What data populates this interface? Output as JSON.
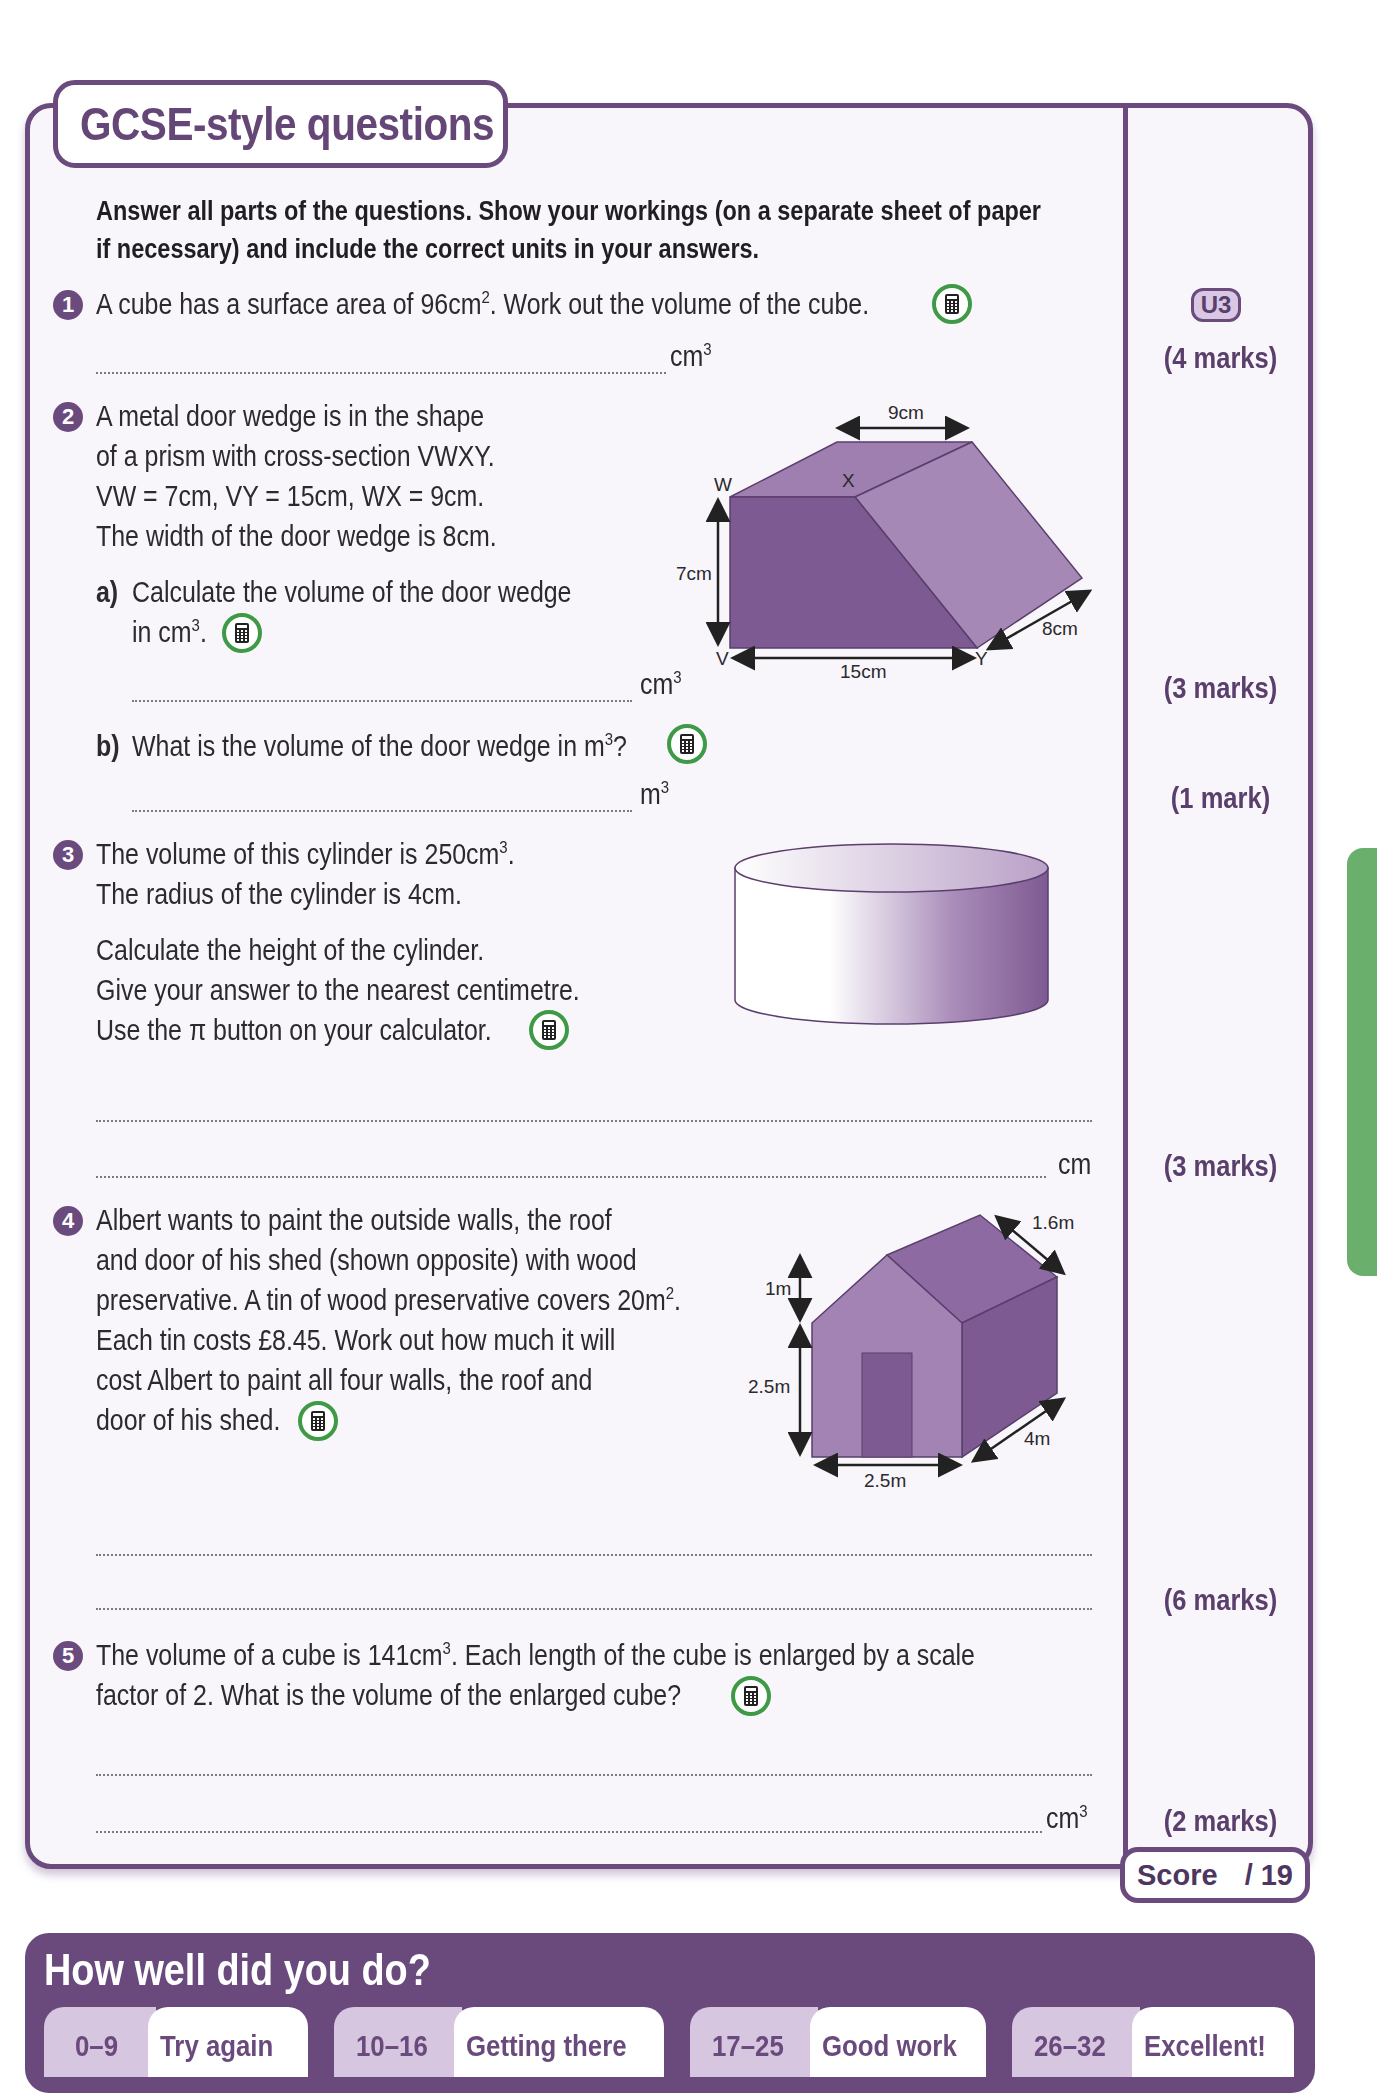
{
  "header": {
    "title": "GCSE-style questions",
    "instructions_line1": "Answer all parts of the questions. Show your workings (on a separate sheet of paper",
    "instructions_line2": "if necessary) and include the correct units in your answers."
  },
  "icons": {
    "calculator": "calculator-icon",
    "question_number": "number-badge"
  },
  "colors": {
    "accent_purple": "#6b4b7e",
    "calculator_green": "#3e9a46",
    "side_tab_green": "#6ab06c",
    "badge_lilac": "#d9c8e3"
  },
  "questions": [
    {
      "number": "1",
      "lines": [
        "A cube has a surface area of 96cm², Work out the volume of the cube."
      ],
      "text_pre": "A cube has a surface area of 96cm",
      "text_sup": "2",
      "text_post": ". Work out the volume of the cube.",
      "unit": "cm³",
      "unit_base": "cm",
      "unit_sup": "3",
      "badge": "U3",
      "marks": "(4 marks)"
    },
    {
      "number": "2",
      "lines": [
        "A metal door wedge is in the shape",
        "of a prism with cross-section VWXY.",
        "VW = 7cm, VY = 15cm, WX = 9cm.",
        "The width of the door wedge is 8cm."
      ],
      "parts": [
        {
          "label": "a)",
          "line1": "Calculate the volume of the door wedge",
          "line2_pre": "in cm",
          "line2_sup": "3",
          "line2_post": ".",
          "unit_base": "cm",
          "unit_sup": "3",
          "marks": "(3 marks)"
        },
        {
          "label": "b)",
          "line1_pre": "What is the volume of the door wedge in m",
          "line1_sup": "3",
          "line1_post": "?",
          "unit_base": "m",
          "unit_sup": "3",
          "marks": "(1 mark)"
        }
      ],
      "diagram": {
        "type": "prism",
        "labels": {
          "W": "W",
          "X": "X",
          "V": "V",
          "Y": "Y"
        },
        "dimensions": {
          "top": "9cm",
          "height": "7cm",
          "base": "15cm",
          "depth": "8cm"
        }
      }
    },
    {
      "number": "3",
      "line1_pre": "The volume of this cylinder is 250cm",
      "line1_sup": "3",
      "line1_post": ".",
      "line2": "The radius of the cylinder is 4cm.",
      "line3": "Calculate the height of the cylinder.",
      "line4": "Give your answer to the nearest centimetre.",
      "line5": "Use the π button on your calculator.",
      "unit": "cm",
      "marks": "(3 marks)",
      "diagram": {
        "type": "cylinder"
      }
    },
    {
      "number": "4",
      "line1": "Albert wants to paint the outside walls, the roof",
      "line2": "and door of his shed (shown opposite) with wood",
      "line3_pre": "preservative. A tin of wood preservative covers 20m",
      "line3_sup": "2",
      "line3_post": ".",
      "line4": "Each tin costs £8.45. Work out how much it will",
      "line5": "cost Albert to paint all four walls, the roof and",
      "line6": "door of his shed.",
      "marks": "(6 marks)",
      "diagram": {
        "type": "shed",
        "dimensions": {
          "roof_slope": "1.6m",
          "roof_height": "1m",
          "wall_height": "2.5m",
          "width": "2.5m",
          "length": "4m"
        }
      }
    },
    {
      "number": "5",
      "line1_pre": "The volume of a cube is 141cm",
      "line1_sup": "3",
      "line1_post": ". Each length of the cube is enlarged by a scale",
      "line2": "factor of 2. What is the volume of the enlarged cube?",
      "unit_base": "cm",
      "unit_sup": "3",
      "marks": "(2 marks)"
    }
  ],
  "score": {
    "label": "Score",
    "total": "/ 19"
  },
  "summary": {
    "title": "How well did you do?",
    "bands": [
      {
        "range": "0–9",
        "label": "Try again"
      },
      {
        "range": "10–16",
        "label": "Getting there"
      },
      {
        "range": "17–25",
        "label": "Good work"
      },
      {
        "range": "26–32",
        "label": "Excellent!"
      }
    ]
  }
}
